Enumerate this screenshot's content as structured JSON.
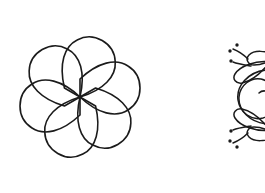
{
  "canvas": {
    "width": 265,
    "height": 193,
    "background_color": "#ffffff",
    "ink_color": "#1b1b1b",
    "description": "Black line-art clipart on a plain white background"
  },
  "figures": [
    {
      "id": "flower",
      "name": "six-petal-flower-outline",
      "label": "Six petal flower outline",
      "style": "outline",
      "stroke_color": "#1b1b1b",
      "fill_color": "none",
      "stroke_width": 1.6,
      "petal_count": 6,
      "bounds": {
        "x": 5,
        "y": 29,
        "width": 151,
        "height": 137
      },
      "center": {
        "x": 80,
        "y": 97
      },
      "geometry": {
        "petal_path": "M 80 97 C 62 80 44 76 32 84 C 16 94 16 118 32 128 C 44 136 62 132 80 115 Z",
        "petal_rotation_step_deg": 60,
        "rotation_offset_deg": 0
      }
    },
    {
      "id": "ornament",
      "name": "decorative-swirl-flourish",
      "label": "Decorative swirl flourish ornament",
      "style": "outline-with-dots",
      "stroke_color": "#1b1b1b",
      "fill_color": "none",
      "stroke_width": 1.5,
      "clipped_edge": "right",
      "bounds": {
        "x": 231,
        "y": 38,
        "width": 34,
        "height": 112
      },
      "center": {
        "x": 268,
        "y": 95
      },
      "elements": [
        {
          "type": "spiral",
          "count": 2
        },
        {
          "type": "teardrop-leaf",
          "count": 6
        },
        {
          "type": "dot",
          "count": 6,
          "radius": 1.6
        },
        {
          "type": "tapered-stroke",
          "count": 4
        }
      ],
      "symmetry": "mirror-horizontal"
    }
  ]
}
